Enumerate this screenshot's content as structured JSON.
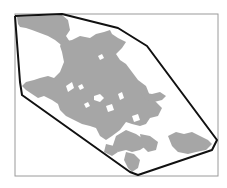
{
  "map": {
    "type": "land-cover extent with convex hull",
    "frame": {
      "x": 15,
      "y": 14,
      "width": 203,
      "height": 162,
      "stroke": "#9a9a9a"
    },
    "hull": {
      "stroke": "#111111",
      "points": "15,16 62,14 118,28 147,46 217,140 212,150 138,175 130,172 22,95 20,82 15,16"
    },
    "region": {
      "fill": "#a6a6a6",
      "label": "urban area"
    },
    "colors": {
      "background": "#ffffff",
      "region": "#a6a6a6",
      "hull": "#111111",
      "frame": "#9a9a9a"
    }
  }
}
